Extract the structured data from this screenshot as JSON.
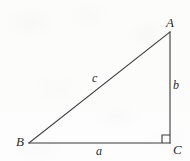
{
  "figure": {
    "kind": "right-triangle-diagram",
    "canvas": {
      "width": 190,
      "height": 161
    },
    "background_color": "#fdfdfc",
    "stroke_color": "#3a3a3a",
    "stroke_width": 1.1,
    "label_color": "#2c2c2c"
  },
  "vertices": {
    "A": {
      "label": "A",
      "x": 170,
      "y": 32
    },
    "B": {
      "label": "B",
      "x": 29,
      "y": 143
    },
    "C": {
      "label": "C",
      "x": 170,
      "y": 143
    }
  },
  "sides": {
    "a": {
      "label": "a",
      "from": "B",
      "to": "C",
      "description": "base / horizontal leg"
    },
    "b": {
      "label": "b",
      "from": "C",
      "to": "A",
      "description": "vertical leg"
    },
    "c": {
      "label": "c",
      "from": "B",
      "to": "A",
      "description": "hypotenuse"
    }
  },
  "markers": {
    "right_angle": {
      "name": "right-angle-square",
      "at_vertex": "C",
      "size": 8
    }
  }
}
